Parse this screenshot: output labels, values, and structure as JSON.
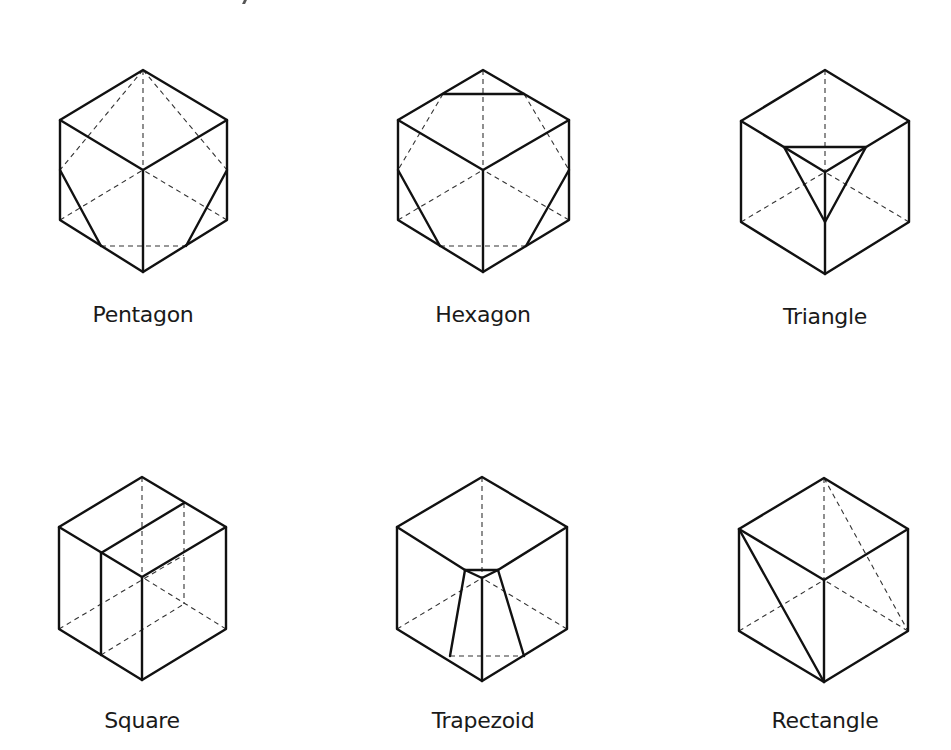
{
  "figure": {
    "panels": [
      {
        "id": "pentagon",
        "label": "Pentagon"
      },
      {
        "id": "hexagon",
        "label": "Hexagon"
      },
      {
        "id": "triangle",
        "label": "Triangle"
      },
      {
        "id": "square",
        "label": "Square"
      },
      {
        "id": "trapezoid",
        "label": "Trapezoid"
      },
      {
        "id": "rectangle",
        "label": "Rectangle"
      }
    ]
  },
  "colors": {
    "line": "#111111",
    "hidden_line": "#333333",
    "background": "#ffffff"
  }
}
